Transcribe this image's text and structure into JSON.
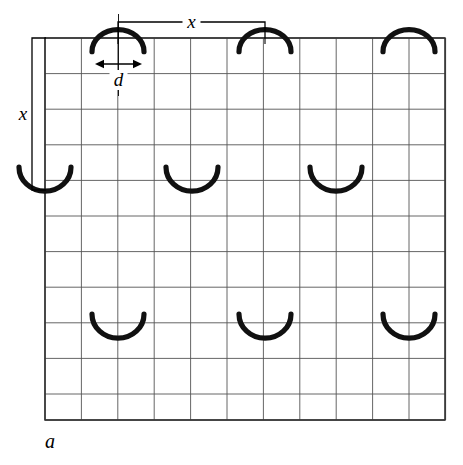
{
  "figure": {
    "panel_label": "a",
    "background_color": "#ffffff",
    "line_color": "#000000",
    "grid_line_color": "#555555",
    "arc_color": "#111111",
    "labels": {
      "horizontal_period": "x",
      "vertical_period": "x",
      "arc_width": "d"
    },
    "grid": {
      "origin_x": 45,
      "origin_y": 38,
      "cell_width": 36.4,
      "cell_height": 35.6,
      "columns": 11,
      "rows": 10.75,
      "right_x": 445,
      "bottom_y": 420
    },
    "annotations": {
      "horizontal_bracket": {
        "label": "x",
        "x_start": 118,
        "x_end": 265,
        "y": 22,
        "tick_drop": 16
      },
      "vertical_bracket": {
        "label": "x",
        "y_start": 38,
        "y_end": 190,
        "x": 32,
        "tick_run": 14
      },
      "d_arrow": {
        "label": "d",
        "x_start": 95,
        "x_end": 142,
        "y": 64
      }
    },
    "arcs": [
      {
        "id": "arc-top-1",
        "cx": 118,
        "cy": 38,
        "rx": 26,
        "ry": 22,
        "orientation": "dome-up",
        "row": "top",
        "clipped": false
      },
      {
        "id": "arc-top-2",
        "cx": 265,
        "cy": 38,
        "rx": 26,
        "ry": 22,
        "orientation": "dome-up",
        "row": "top",
        "clipped": false
      },
      {
        "id": "arc-top-3",
        "cx": 409,
        "cy": 38,
        "rx": 26,
        "ry": 22,
        "orientation": "dome-up",
        "row": "top",
        "clipped": false
      },
      {
        "id": "arc-mid-0",
        "cx": 45,
        "cy": 190,
        "rx": 26,
        "ry": 24,
        "orientation": "cup-up",
        "row": "middle",
        "clipped": true
      },
      {
        "id": "arc-mid-1",
        "cx": 192,
        "cy": 190,
        "rx": 26,
        "ry": 24,
        "orientation": "cup-up",
        "row": "middle",
        "clipped": false
      },
      {
        "id": "arc-mid-2",
        "cx": 336,
        "cy": 190,
        "rx": 26,
        "ry": 24,
        "orientation": "cup-up",
        "row": "middle",
        "clipped": false
      },
      {
        "id": "arc-bot-1",
        "cx": 118,
        "cy": 337,
        "rx": 26,
        "ry": 24,
        "orientation": "cup-up",
        "row": "bottom",
        "clipped": false
      },
      {
        "id": "arc-bot-2",
        "cx": 265,
        "cy": 337,
        "rx": 26,
        "ry": 24,
        "orientation": "cup-up",
        "row": "bottom",
        "clipped": false
      },
      {
        "id": "arc-bot-3",
        "cx": 409,
        "cy": 337,
        "rx": 26,
        "ry": 24,
        "orientation": "cup-up",
        "row": "bottom",
        "clipped": false
      }
    ]
  }
}
